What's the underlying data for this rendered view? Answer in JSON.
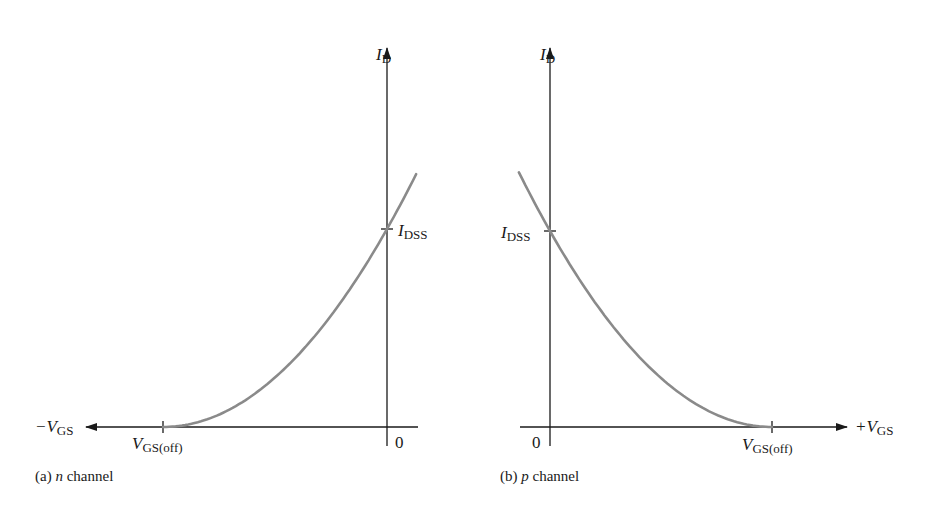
{
  "figure": {
    "panel_a": {
      "caption_prefix": "(a) ",
      "caption_italic": "n",
      "caption_suffix": " channel",
      "y_axis": {
        "symbol": "I",
        "subscript": "D"
      },
      "x_axis": {
        "symbol": "−V",
        "subscript": "GS"
      },
      "idss_label": {
        "symbol": "I",
        "subscript": "DSS"
      },
      "voff_label": {
        "symbol": "V",
        "subscript": "GS(off)"
      },
      "origin_label": "0"
    },
    "panel_b": {
      "caption_prefix": "(b) ",
      "caption_italic": "p",
      "caption_suffix": " channel",
      "y_axis": {
        "symbol": "I",
        "subscript": "D"
      },
      "x_axis": {
        "symbol": "+V",
        "subscript": "GS"
      },
      "idss_label": {
        "symbol": "I",
        "subscript": "DSS"
      },
      "voff_label": {
        "symbol": "V",
        "subscript": "GS(off)"
      },
      "origin_label": "0"
    },
    "colors": {
      "axis": "#1a1a1a",
      "curve": "#8a8a8a",
      "background": "#ffffff"
    }
  },
  "chart_data": [
    {
      "type": "line",
      "title": "(a) n channel — JFET transfer characteristic",
      "xlabel": "−V_GS",
      "ylabel": "I_D",
      "x_ticks": [
        "V_GS(off)",
        "0"
      ],
      "y_ticks": [
        "I_DSS"
      ],
      "equation": "I_D = I_DSS (1 − V_GS / V_GS(off))^2",
      "series": [
        {
          "name": "I_D",
          "x_normalized_VGS_over_Voff": [
            1.0,
            0.75,
            0.5,
            0.25,
            0.0,
            -0.13
          ],
          "y_normalized_ID_over_IDSS": [
            0.0,
            0.0625,
            0.25,
            0.5625,
            1.0,
            1.28
          ]
        }
      ],
      "grid": false,
      "legend": false
    },
    {
      "type": "line",
      "title": "(b) p channel — JFET transfer characteristic",
      "xlabel": "+V_GS",
      "ylabel": "I_D",
      "x_ticks": [
        "0",
        "V_GS(off)"
      ],
      "y_ticks": [
        "I_DSS"
      ],
      "equation": "I_D = I_DSS (1 − V_GS / V_GS(off))^2",
      "series": [
        {
          "name": "I_D",
          "x_normalized_VGS_over_Voff": [
            -0.14,
            0.0,
            0.25,
            0.5,
            0.75,
            1.0
          ],
          "y_normalized_ID_over_IDSS": [
            1.3,
            1.0,
            0.5625,
            0.25,
            0.0625,
            0.0
          ]
        }
      ],
      "grid": false,
      "legend": false
    }
  ]
}
